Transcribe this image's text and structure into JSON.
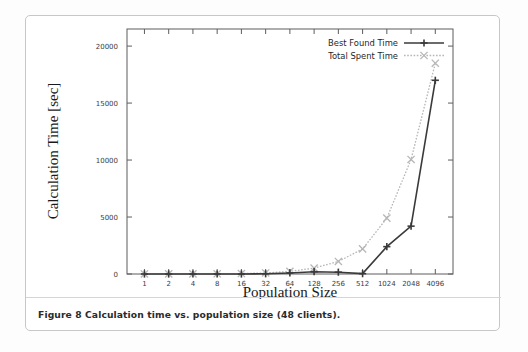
{
  "figure": {
    "caption": "Figure 8 Calculation time vs. population size (48 clients)."
  },
  "chart_data": {
    "type": "line",
    "title": "",
    "xlabel": "Population Size",
    "ylabel": "Calculation Time [sec]",
    "categories": [
      "1",
      "2",
      "4",
      "8",
      "16",
      "32",
      "64",
      "128",
      "256",
      "512",
      "1024",
      "2048",
      "4096"
    ],
    "ylim": [
      0,
      21500
    ],
    "yticks": [
      "0",
      "5000",
      "10000",
      "15000",
      "20000"
    ],
    "ytick_values": [
      0,
      5000,
      10000,
      15000,
      20000
    ],
    "grid": false,
    "legend_position": "top-right",
    "series": [
      {
        "name": "Best Found Time",
        "color": "#3a3a3a",
        "marker": "plus",
        "dash": "none",
        "values": [
          0,
          0,
          0,
          0,
          0,
          20,
          90,
          200,
          160,
          30,
          2400,
          4200,
          17000
        ]
      },
      {
        "name": "Total Spent Time",
        "color": "#b6b6b6",
        "marker": "cross",
        "dash": "dotted",
        "values": [
          5,
          8,
          12,
          20,
          40,
          90,
          230,
          520,
          1100,
          2200,
          4900,
          10050,
          18500
        ]
      }
    ]
  }
}
